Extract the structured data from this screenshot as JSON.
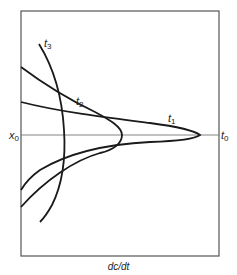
{
  "figure": {
    "x_axis_label": "dc/dt",
    "origin_label": {
      "var": "x",
      "sub": "0"
    },
    "end_label": {
      "var": "t",
      "sub": "0"
    },
    "curves": [
      {
        "id": "t1",
        "var": "t",
        "sub": "1",
        "description": "sharp-tipped curve extending to t0 point on axis"
      },
      {
        "id": "t2",
        "var": "t",
        "sub": "2",
        "description": "blunt-tipped curve symmetric about axis"
      },
      {
        "id": "t3",
        "var": "t",
        "sub": "3",
        "description": "nearly vertical curve crossing axis"
      }
    ]
  },
  "colors": {
    "frame": "#555555",
    "curve": "#1a1a1a",
    "axis": "#777777",
    "background": "#ffffff"
  }
}
